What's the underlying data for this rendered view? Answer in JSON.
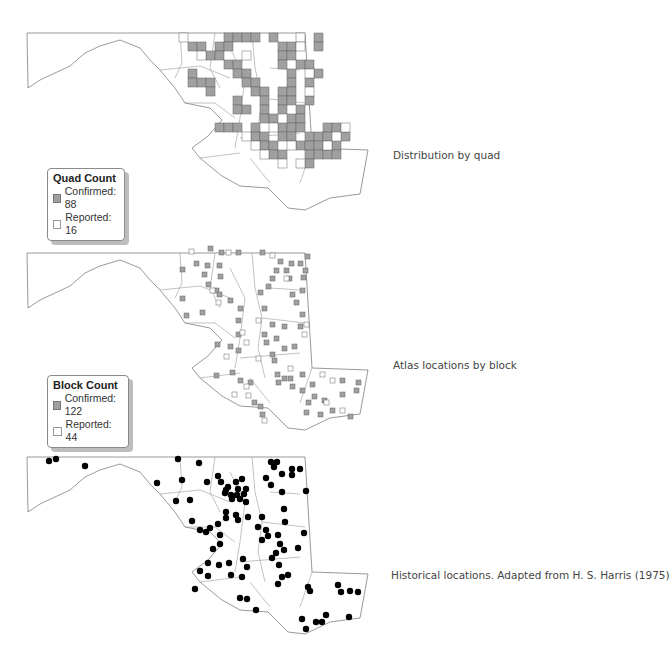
{
  "panels": [
    {
      "id": "quad",
      "caption": "Distribution by quad",
      "legend": {
        "title": "Quad Count",
        "items": [
          {
            "label": "Confirmed: 88",
            "type": "confirmed"
          },
          {
            "label": "Reported: 16",
            "type": "reported"
          }
        ]
      }
    },
    {
      "id": "block",
      "caption": "Atlas locations by block",
      "legend": {
        "title": "Block Count",
        "items": [
          {
            "label": "Confirmed: 122",
            "type": "confirmed"
          },
          {
            "label": "Reported: 44",
            "type": "reported"
          }
        ]
      }
    },
    {
      "id": "historical",
      "caption": "Historical locations. Adapted from H. S. Harris (1975)"
    }
  ],
  "colors": {
    "confirmed_fill": "#a0a0a0",
    "reported_fill": "#ffffff",
    "outline": "#555555",
    "dot": "#000000"
  }
}
